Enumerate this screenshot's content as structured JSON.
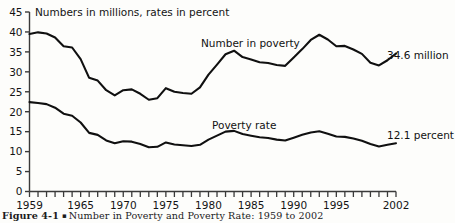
{
  "figure": {
    "caption_number": "Figure 4-1",
    "caption_marker": "▪",
    "caption_text": "Number in Poverty and Poverty Rate: 1959 to 2002"
  },
  "chart_data": {
    "type": "line",
    "title": "",
    "subtitle": "Numbers in millions, rates in percent",
    "xlabel": "",
    "ylabel": "",
    "xlim": [
      1959,
      2002
    ],
    "ylim": [
      0,
      45
    ],
    "ytick_step": 5,
    "yticks": [
      0,
      5,
      10,
      15,
      20,
      25,
      30,
      35,
      40,
      45
    ],
    "ytick_labels": [
      "0",
      "5",
      "10",
      "15",
      "20",
      "25",
      "30",
      "35",
      "40",
      "45"
    ],
    "xticks_every": 1,
    "xtick_labels": [
      "1959",
      "1965",
      "1970",
      "1975",
      "1980",
      "1985",
      "1990",
      "1995",
      "2002"
    ],
    "xtick_label_years": [
      1959,
      1965,
      1970,
      1975,
      1980,
      1985,
      1990,
      1995,
      2002
    ],
    "grid": false,
    "legend": "inline-annotations",
    "line_color": "#101010",
    "axis_color": "#3a3a3a",
    "x": [
      1959,
      1960,
      1961,
      1962,
      1963,
      1964,
      1965,
      1966,
      1967,
      1968,
      1969,
      1970,
      1971,
      1972,
      1973,
      1974,
      1975,
      1976,
      1977,
      1978,
      1979,
      1980,
      1981,
      1982,
      1983,
      1984,
      1985,
      1986,
      1987,
      1988,
      1989,
      1990,
      1991,
      1992,
      1993,
      1994,
      1995,
      1996,
      1997,
      1998,
      1999,
      2000,
      2001,
      2002
    ],
    "series": [
      {
        "name": "Number in poverty",
        "units": "millions",
        "label": "Number in poverty",
        "endpoint_label": "34.6 million",
        "endpoint_value": 34.6,
        "values": [
          39.5,
          39.9,
          39.6,
          38.6,
          36.4,
          36.1,
          33.2,
          28.5,
          27.8,
          25.4,
          24.1,
          25.4,
          25.6,
          24.5,
          23.0,
          23.4,
          25.9,
          25.0,
          24.7,
          24.5,
          26.1,
          29.3,
          31.8,
          34.4,
          35.3,
          33.7,
          33.1,
          32.4,
          32.2,
          31.7,
          31.5,
          33.6,
          35.7,
          38.0,
          39.3,
          38.1,
          36.4,
          36.5,
          35.6,
          34.5,
          32.3,
          31.6,
          32.9,
          34.6
        ]
      },
      {
        "name": "Poverty rate",
        "units": "percent",
        "label": "Poverty rate",
        "endpoint_label": "12.1 percent",
        "endpoint_value": 12.1,
        "values": [
          22.4,
          22.2,
          21.9,
          21.0,
          19.5,
          19.0,
          17.3,
          14.7,
          14.2,
          12.8,
          12.1,
          12.6,
          12.5,
          11.9,
          11.1,
          11.2,
          12.3,
          11.8,
          11.6,
          11.4,
          11.7,
          13.0,
          14.0,
          15.0,
          15.2,
          14.4,
          14.0,
          13.6,
          13.4,
          13.0,
          12.8,
          13.5,
          14.2,
          14.8,
          15.1,
          14.5,
          13.8,
          13.7,
          13.3,
          12.7,
          11.9,
          11.3,
          11.7,
          12.1
        ]
      }
    ]
  }
}
